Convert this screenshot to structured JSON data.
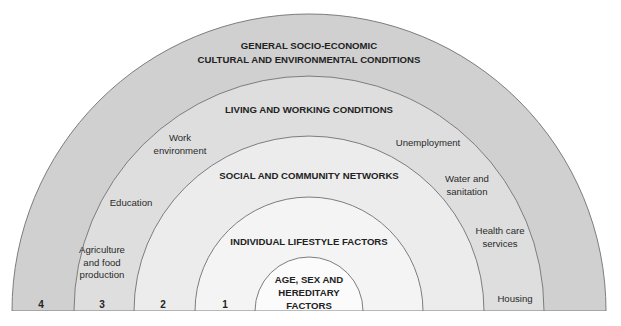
{
  "diagram": {
    "layers": [
      {
        "number": "4",
        "name": "outer",
        "heading_lines": [
          "GENERAL SOCIO-ECONOMIC",
          "CULTURAL AND ENVIRONMENTAL CONDITIONS"
        ],
        "fill": "#d0d0d0"
      },
      {
        "number": "3",
        "name": "living-working",
        "heading_lines": [
          "LIVING AND WORKING CONDITIONS"
        ],
        "fill": "#dedede"
      },
      {
        "number": "2",
        "name": "social-community",
        "heading_lines": [
          "SOCIAL AND COMMUNITY NETWORKS"
        ],
        "fill": "#ececec"
      },
      {
        "number": "1",
        "name": "individual-lifestyle",
        "heading_lines": [
          "INDIVIDUAL LIFESTYLE FACTORS"
        ],
        "fill": "#f4f4f4"
      },
      {
        "number": "",
        "name": "core",
        "heading_lines": [
          "AGE, SEX AND",
          "HEREDITARY",
          "FACTORS"
        ],
        "fill": "#fbfbfb"
      }
    ],
    "living_working_items": [
      {
        "lines": [
          "Agriculture",
          "and food",
          "production"
        ]
      },
      {
        "lines": [
          "Education"
        ]
      },
      {
        "lines": [
          "Work",
          "environment"
        ]
      },
      {
        "lines": [
          "Unemployment"
        ]
      },
      {
        "lines": [
          "Water and",
          "sanitation"
        ]
      },
      {
        "lines": [
          "Health care",
          "services"
        ]
      },
      {
        "lines": [
          "Housing"
        ]
      }
    ],
    "stroke_color": "#7d7d7d"
  }
}
